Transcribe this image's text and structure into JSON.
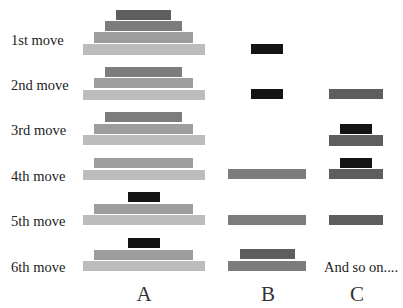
{
  "colors": {
    "disc_black": "#141414",
    "disc_1": "#5e5e5e",
    "disc_2": "#7c7c7c",
    "disc_3": "#9d9d9d",
    "disc_4": "#bcbcbc"
  },
  "moves": [
    {
      "label": "1st move",
      "label_top": 33
    },
    {
      "label": "2nd move",
      "label_top": 78
    },
    {
      "label": "3rd move",
      "label_top": 123
    },
    {
      "label": "4th move",
      "label_top": 169
    },
    {
      "label": "5th move",
      "label_top": 214
    },
    {
      "label": "6th move",
      "label_top": 260
    }
  ],
  "discs": [
    {
      "move": 1,
      "peg": "A",
      "size": "disc_1",
      "x": 116,
      "y": 10,
      "w": 55,
      "h": 10
    },
    {
      "move": 1,
      "peg": "A",
      "size": "disc_2",
      "x": 105,
      "y": 21,
      "w": 77,
      "h": 10
    },
    {
      "move": 1,
      "peg": "A",
      "size": "disc_3",
      "x": 94,
      "y": 32,
      "w": 99,
      "h": 11
    },
    {
      "move": 1,
      "peg": "A",
      "size": "disc_4",
      "x": 83,
      "y": 44,
      "w": 122,
      "h": 11
    },
    {
      "move": 1,
      "peg": "B",
      "size": "disc_black",
      "x": 251,
      "y": 44,
      "w": 32,
      "h": 10
    },
    {
      "move": 2,
      "peg": "A",
      "size": "disc_2",
      "x": 105,
      "y": 67,
      "w": 77,
      "h": 10
    },
    {
      "move": 2,
      "peg": "A",
      "size": "disc_3",
      "x": 94,
      "y": 78,
      "w": 99,
      "h": 10
    },
    {
      "move": 2,
      "peg": "A",
      "size": "disc_4",
      "x": 83,
      "y": 90,
      "w": 122,
      "h": 10
    },
    {
      "move": 2,
      "peg": "B",
      "size": "disc_black",
      "x": 251,
      "y": 89,
      "w": 32,
      "h": 10
    },
    {
      "move": 2,
      "peg": "C",
      "size": "disc_1",
      "x": 329,
      "y": 89,
      "w": 54,
      "h": 10
    },
    {
      "move": 3,
      "peg": "A",
      "size": "disc_2",
      "x": 105,
      "y": 112,
      "w": 77,
      "h": 10
    },
    {
      "move": 3,
      "peg": "A",
      "size": "disc_3",
      "x": 94,
      "y": 124,
      "w": 99,
      "h": 10
    },
    {
      "move": 3,
      "peg": "A",
      "size": "disc_4",
      "x": 83,
      "y": 135,
      "w": 122,
      "h": 10
    },
    {
      "move": 3,
      "peg": "C",
      "size": "disc_black",
      "x": 340,
      "y": 124,
      "w": 32,
      "h": 10
    },
    {
      "move": 3,
      "peg": "C",
      "size": "disc_1",
      "x": 329,
      "y": 135,
      "w": 54,
      "h": 11
    },
    {
      "move": 4,
      "peg": "A",
      "size": "disc_3",
      "x": 94,
      "y": 158,
      "w": 99,
      "h": 10
    },
    {
      "move": 4,
      "peg": "A",
      "size": "disc_4",
      "x": 83,
      "y": 170,
      "w": 122,
      "h": 10
    },
    {
      "move": 4,
      "peg": "B",
      "size": "disc_2",
      "x": 228,
      "y": 169,
      "w": 78,
      "h": 10
    },
    {
      "move": 4,
      "peg": "C",
      "size": "disc_black",
      "x": 340,
      "y": 158,
      "w": 32,
      "h": 10
    },
    {
      "move": 4,
      "peg": "C",
      "size": "disc_1",
      "x": 329,
      "y": 169,
      "w": 54,
      "h": 10
    },
    {
      "move": 5,
      "peg": "A",
      "size": "disc_black",
      "x": 128,
      "y": 192,
      "w": 32,
      "h": 10
    },
    {
      "move": 5,
      "peg": "A",
      "size": "disc_3",
      "x": 94,
      "y": 204,
      "w": 99,
      "h": 10
    },
    {
      "move": 5,
      "peg": "A",
      "size": "disc_4",
      "x": 83,
      "y": 215,
      "w": 122,
      "h": 10
    },
    {
      "move": 5,
      "peg": "B",
      "size": "disc_2",
      "x": 228,
      "y": 215,
      "w": 78,
      "h": 10
    },
    {
      "move": 5,
      "peg": "C",
      "size": "disc_1",
      "x": 329,
      "y": 215,
      "w": 54,
      "h": 10
    },
    {
      "move": 6,
      "peg": "A",
      "size": "disc_black",
      "x": 128,
      "y": 238,
      "w": 32,
      "h": 10
    },
    {
      "move": 6,
      "peg": "A",
      "size": "disc_3",
      "x": 94,
      "y": 250,
      "w": 99,
      "h": 10
    },
    {
      "move": 6,
      "peg": "A",
      "size": "disc_4",
      "x": 83,
      "y": 261,
      "w": 122,
      "h": 10
    },
    {
      "move": 6,
      "peg": "B",
      "size": "disc_1",
      "x": 240,
      "y": 249,
      "w": 55,
      "h": 10
    },
    {
      "move": 6,
      "peg": "B",
      "size": "disc_2",
      "x": 228,
      "y": 261,
      "w": 78,
      "h": 10
    }
  ],
  "note": {
    "text": "And so on....",
    "x": 324,
    "y": 260
  },
  "pegs": [
    {
      "label": "A",
      "cx": 144
    },
    {
      "label": "B",
      "cx": 268
    },
    {
      "label": "C",
      "cx": 357
    }
  ]
}
